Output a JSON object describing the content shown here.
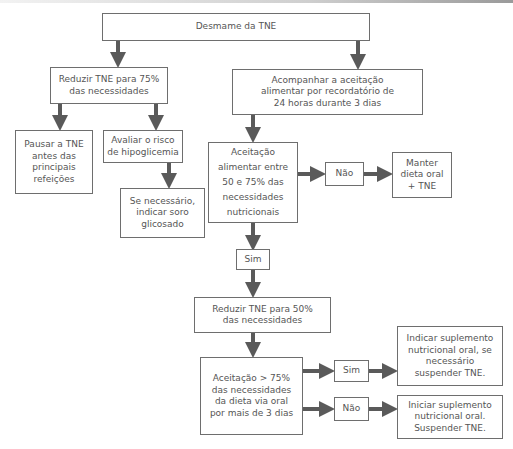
{
  "diagram": {
    "type": "flowchart",
    "colors": {
      "arrow": "#5a5a5a",
      "box_border": "#6e6e6e",
      "text": "#555555"
    },
    "nodes": {
      "root": "Desmame da TNE",
      "reduce75": "Reduzir TNE para 75%\ndas necessidades",
      "follow_up": "Acompanhar a aceitação\nalimentar por recordatório de\n24 horas durante 3 dias",
      "pause": "Pausar a TNE\nantes das\nprincipais\nrefeições",
      "hypo_risk": "Avaliar o risco\nde hipoglicemia",
      "glucose": "Se necessário,\nindicar soro\nglicosado",
      "acceptance_50_75": "Aceitação\nalimentar entre\n50 e 75% das\nnecessidades\nnutricionais",
      "no_1": "Não",
      "keep_diet": "Manter\ndieta oral\n+ TNE",
      "yes_1": "Sim",
      "reduce50": "Reduzir TNE para 50%\ndas necessidades",
      "acceptance_75": "Aceitação > 75%\ndas necessidades\nda dieta via oral\npor mais de 3 dias",
      "yes_2": "Sim",
      "indicate_supplement": "Indicar suplemento\nnutricional oral, se\nnecessário\nsuspender TNE.",
      "no_2": "Não",
      "start_supplement": "Iniciar suplemento\nnutricional oral.\nSuspender TNE."
    },
    "edges": [
      [
        "root",
        "reduce75"
      ],
      [
        "root",
        "follow_up"
      ],
      [
        "reduce75",
        "pause"
      ],
      [
        "reduce75",
        "hypo_risk"
      ],
      [
        "hypo_risk",
        "glucose"
      ],
      [
        "follow_up",
        "acceptance_50_75"
      ],
      [
        "acceptance_50_75",
        "no_1"
      ],
      [
        "no_1",
        "keep_diet"
      ],
      [
        "acceptance_50_75",
        "yes_1"
      ],
      [
        "yes_1",
        "reduce50"
      ],
      [
        "reduce50",
        "acceptance_75"
      ],
      [
        "acceptance_75",
        "yes_2"
      ],
      [
        "yes_2",
        "indicate_supplement"
      ],
      [
        "acceptance_75",
        "no_2"
      ],
      [
        "no_2",
        "start_supplement"
      ]
    ]
  }
}
